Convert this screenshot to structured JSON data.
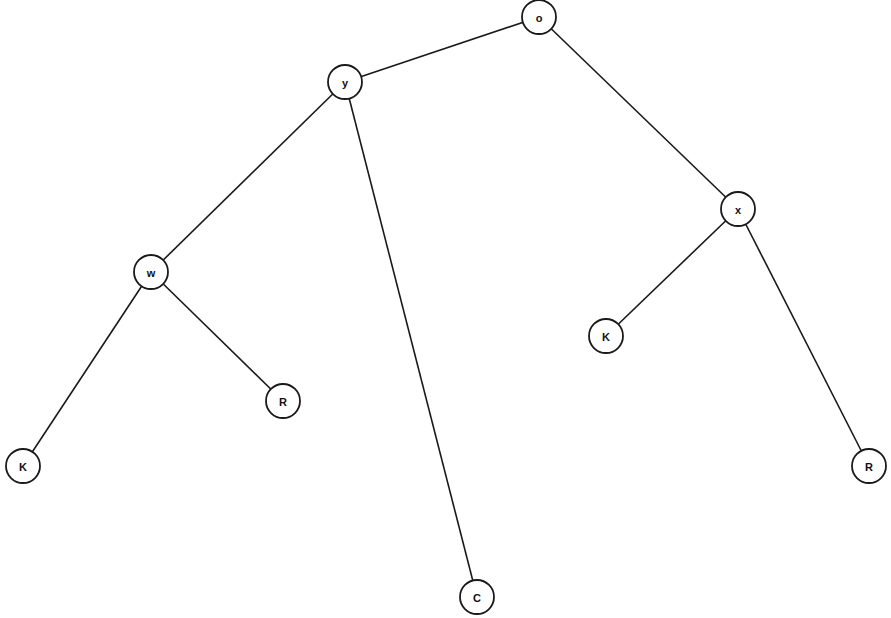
{
  "diagram": {
    "type": "tree",
    "node_radius": 17,
    "colors": {
      "stroke": "#1a1a1a",
      "fill": "#ffffff",
      "text": "#111111",
      "background": "#ffffff"
    },
    "nodes": [
      {
        "id": "n_o",
        "label": "o",
        "x": 539,
        "y": 17
      },
      {
        "id": "n_y",
        "label": "y",
        "x": 345,
        "y": 82
      },
      {
        "id": "n_x",
        "label": "x",
        "x": 738,
        "y": 209
      },
      {
        "id": "n_w",
        "label": "w",
        "x": 151,
        "y": 272
      },
      {
        "id": "n_K2",
        "label": "K",
        "x": 606,
        "y": 336
      },
      {
        "id": "n_R1",
        "label": "R",
        "x": 283,
        "y": 401
      },
      {
        "id": "n_K1",
        "label": "K",
        "x": 23,
        "y": 466
      },
      {
        "id": "n_R2",
        "label": "R",
        "x": 869,
        "y": 466
      },
      {
        "id": "n_C",
        "label": "C",
        "x": 477,
        "y": 597
      }
    ],
    "edges": [
      {
        "from": "n_o",
        "to": "n_y"
      },
      {
        "from": "n_o",
        "to": "n_x"
      },
      {
        "from": "n_y",
        "to": "n_w"
      },
      {
        "from": "n_y",
        "to": "n_C"
      },
      {
        "from": "n_w",
        "to": "n_K1"
      },
      {
        "from": "n_w",
        "to": "n_R1"
      },
      {
        "from": "n_x",
        "to": "n_K2"
      },
      {
        "from": "n_x",
        "to": "n_R2"
      }
    ]
  }
}
